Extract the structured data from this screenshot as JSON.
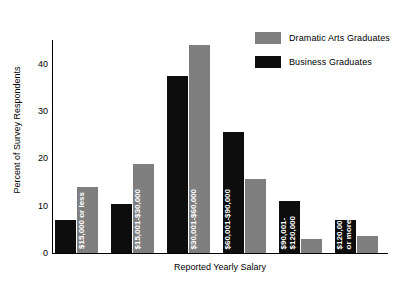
{
  "chart_data": {
    "type": "bar",
    "title": "",
    "xlabel": "Reported Yearly Salary",
    "ylabel": "Percent of Survey Respondents",
    "ylim": [
      0,
      45
    ],
    "yticks": [
      0,
      10,
      20,
      30,
      40
    ],
    "ytick_labels": [
      "0",
      "10",
      "20",
      "30",
      "40"
    ],
    "grid": false,
    "legend_position": "top-right",
    "categories": [
      "$15,000 or less",
      "$15,001-$30,000",
      "$30,001-$60,000",
      "$60,001-$90,000",
      "$90,001-\n$120,000",
      "$120,001\nor more"
    ],
    "series": [
      {
        "name": "Business Graduates",
        "color": "#0d0d0d",
        "values": [
          7.0,
          10.3,
          37.3,
          25.5,
          11.0,
          7.0
        ]
      },
      {
        "name": "Dramatic Arts Graduates",
        "color": "#7f7f7f",
        "values": [
          14.0,
          18.8,
          44.0,
          15.6,
          3.0,
          3.7
        ]
      }
    ]
  },
  "legend": {
    "items": [
      {
        "label": "Dramatic Arts Graduates",
        "color": "#7f7f7f"
      },
      {
        "label": "Business Graduates",
        "color": "#0d0d0d"
      }
    ]
  }
}
